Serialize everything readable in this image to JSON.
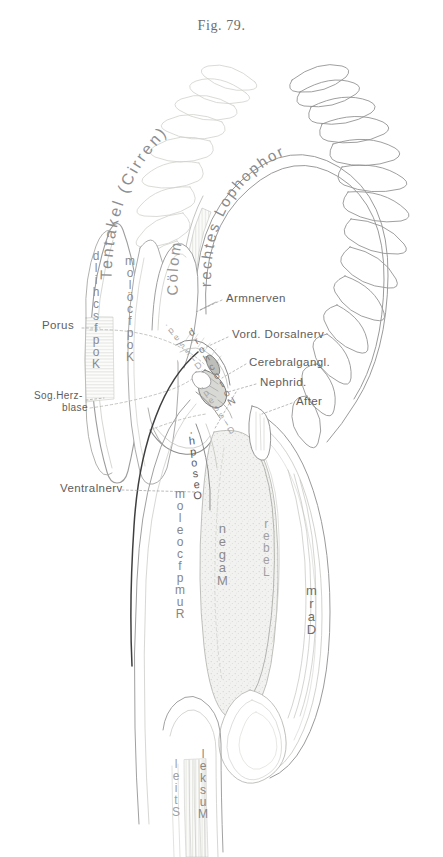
{
  "figure": {
    "title": "Fig. 79.",
    "caption_language": "German"
  },
  "colors": {
    "background": "#ffffff",
    "ink_dark": "#4a4a4a",
    "ink_mid": "#7d7d7d",
    "ink_light": "#a9a9a9",
    "ink_faint": "#c8c8c8",
    "fill_tint": "#ededed",
    "leader_line": "#9a9a9a"
  },
  "curved_labels": [
    {
      "id": "tentakel",
      "text": "Tentakel (Cirren)",
      "tone": "mid"
    },
    {
      "id": "coelom",
      "text": "Cölom",
      "tone": "mid"
    },
    {
      "id": "rechtes-lophophor",
      "text": "rechtes Lophophor",
      "tone": "mid"
    }
  ],
  "vertical_labels": [
    {
      "id": "kopfschild",
      "text": "Kopfschild",
      "x": 92,
      "y": 250,
      "size": 12,
      "tone": "mid"
    },
    {
      "id": "kopfcoelom",
      "text": "Kopfcölom",
      "x": 125,
      "y": 255,
      "size": 12,
      "tone": "mid"
    },
    {
      "id": "notochord",
      "text": "Notochord",
      "x": 186,
      "y": 330,
      "size": 10,
      "tone": "mid"
    },
    {
      "id": "dissepiment-upper",
      "text": "Dissep.",
      "x": 160,
      "y": 320,
      "size": 9,
      "tone": "light"
    },
    {
      "id": "dissepiment-lower",
      "text": "Dissep.",
      "x": 196,
      "y": 382,
      "size": 9,
      "tone": "light"
    },
    {
      "id": "oesophagus",
      "text": "Oesoph.",
      "x": 186,
      "y": 425,
      "size": 11,
      "tone": "dark"
    },
    {
      "id": "rumpfcoelom",
      "text": "Rumpfcoelom",
      "x": 175,
      "y": 490,
      "size": 12,
      "tone": "mid"
    },
    {
      "id": "magen",
      "text": "Magen",
      "x": 217,
      "y": 520,
      "size": 13,
      "tone": "mid"
    },
    {
      "id": "leber",
      "text": "Leber",
      "x": 263,
      "y": 515,
      "size": 12,
      "tone": "light"
    },
    {
      "id": "darm",
      "text": "Darm",
      "x": 306,
      "y": 580,
      "size": 13,
      "tone": "dark"
    },
    {
      "id": "stiel",
      "text": "Stiel",
      "x": 172,
      "y": 755,
      "size": 12,
      "tone": "light"
    },
    {
      "id": "muskel",
      "text": "Muskel",
      "x": 198,
      "y": 745,
      "size": 12,
      "tone": "mid"
    }
  ],
  "leader_labels": [
    {
      "id": "porus",
      "text": "Porus",
      "x": 42,
      "y": 325,
      "align": "left"
    },
    {
      "id": "sog-herzblase-line1",
      "text": "Sog.Herz-",
      "x": 34,
      "y": 395,
      "align": "left"
    },
    {
      "id": "sog-herzblase-line2",
      "text": "blase",
      "x": 48,
      "y": 407,
      "align": "left"
    },
    {
      "id": "ventralnerv",
      "text": "Ventralnerv",
      "x": 60,
      "y": 487,
      "align": "left"
    },
    {
      "id": "armnerven",
      "text": "Armnerven",
      "x": 226,
      "y": 297,
      "align": "left"
    },
    {
      "id": "vord-dorsalnerv",
      "text": "Vord. Dorsalnerv",
      "x": 232,
      "y": 333,
      "align": "left"
    },
    {
      "id": "cerebralgangl",
      "text": "Cerebralgangl.",
      "x": 249,
      "y": 361,
      "align": "left"
    },
    {
      "id": "nephrid",
      "text": "Nephrid.",
      "x": 260,
      "y": 381,
      "align": "left"
    },
    {
      "id": "after",
      "text": "After",
      "x": 296,
      "y": 400,
      "align": "left"
    }
  ]
}
